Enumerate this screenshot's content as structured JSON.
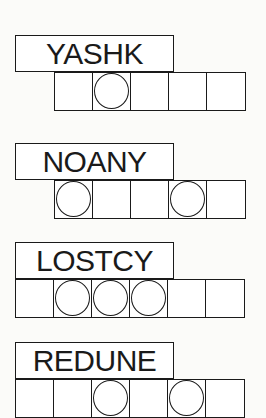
{
  "puzzles": [
    {
      "scrambled": "YASHK",
      "box_count": 5,
      "circled_positions": [
        2
      ]
    },
    {
      "scrambled": "NOANY",
      "box_count": 5,
      "circled_positions": [
        1,
        4
      ]
    },
    {
      "scrambled": "LOSTCY",
      "box_count": 6,
      "circled_positions": [
        2,
        3,
        4
      ]
    },
    {
      "scrambled": "REDUNE",
      "box_count": 6,
      "circled_positions": [
        3,
        5
      ]
    }
  ]
}
